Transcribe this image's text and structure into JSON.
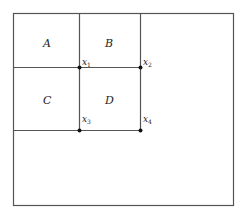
{
  "diagram": {
    "regions": [
      {
        "id": "A",
        "label": "A"
      },
      {
        "id": "B",
        "label": "B"
      },
      {
        "id": "C",
        "label": "C"
      },
      {
        "id": "D",
        "label": "D"
      }
    ],
    "points": [
      {
        "id": "x1",
        "base": "x",
        "sub": "1"
      },
      {
        "id": "x2",
        "base": "x",
        "sub": "2"
      },
      {
        "id": "x3",
        "base": "x",
        "sub": "3"
      },
      {
        "id": "x4",
        "base": "x",
        "sub": "4"
      }
    ],
    "colors": {
      "line": "#555555",
      "point": "#111111",
      "background": "#ffffff"
    }
  }
}
